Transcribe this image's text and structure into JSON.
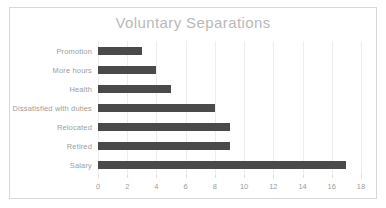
{
  "chart_data": {
    "type": "bar",
    "orientation": "horizontal",
    "title": "Voluntary Separations",
    "xlabel": "",
    "ylabel": "",
    "categories": [
      "Promotion",
      "More hours",
      "Health",
      "Dissatisfied with duties",
      "Relocated",
      "Retired",
      "Salary"
    ],
    "values": [
      3,
      4,
      5,
      8,
      9,
      9,
      17
    ],
    "xlim": [
      0,
      18
    ],
    "xticks": [
      0,
      2,
      4,
      6,
      8,
      10,
      12,
      14,
      16,
      18
    ],
    "xtick_labels": [
      "0",
      "2",
      "4",
      "6",
      "8",
      "10",
      "12",
      "14",
      "16",
      "18"
    ],
    "grid": true,
    "grid_axis": "x",
    "legend": false,
    "bar_color": "#4a4a4a",
    "text_color": "#9d9d9d",
    "title_color": "#b9b9b9",
    "grid_color": "#ededed",
    "background_color": "#ffffff",
    "border_color": "#d8d8d8"
  }
}
